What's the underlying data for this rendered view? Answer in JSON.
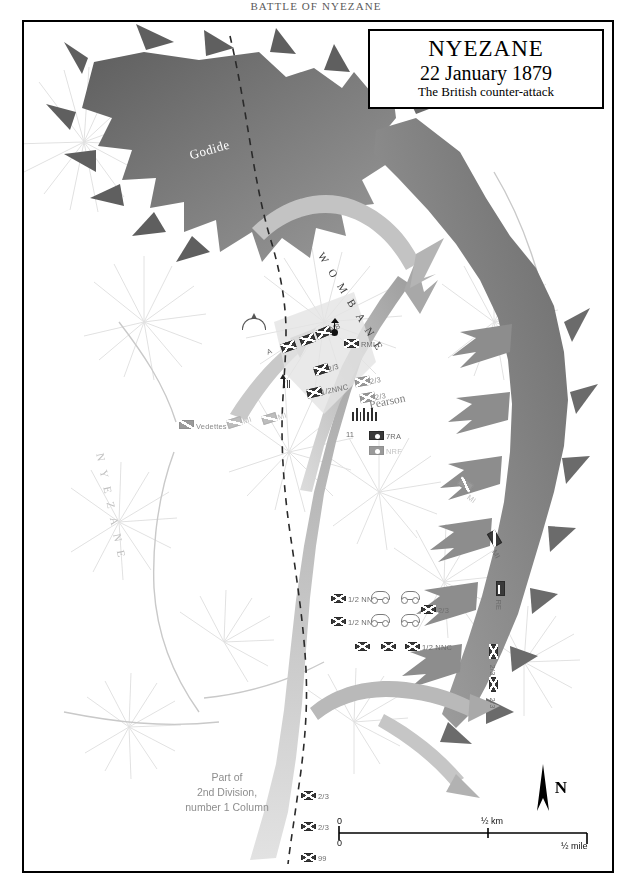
{
  "running_head": "BATTLE OF NYEZANE",
  "title_box": {
    "line1": "NYEZANE",
    "line2": "22 January 1879",
    "line3": "The British counter-attack"
  },
  "place_labels": {
    "godide": "Godide",
    "wombane": "WOMBANE",
    "nyezane": "NYEZANE",
    "commander": "Pearson"
  },
  "note": {
    "line1": "Part of",
    "line2": "2nd Division,",
    "line3": "number 1 Column"
  },
  "scale": {
    "km_zero": "0",
    "km_half": "½ km",
    "mile_zero": "0",
    "mile_half": "½ mile"
  },
  "north": {
    "label": "N"
  },
  "units": [
    {
      "id": "u-a",
      "label": "A",
      "type": "infantry",
      "shade": "dark",
      "x": 257,
      "y": 320,
      "rot": -20,
      "lx": 243,
      "ly": 326,
      "fade": "dk"
    },
    {
      "id": "u-a2",
      "label": "A",
      "type": "infantry",
      "shade": "dark",
      "x": 276,
      "y": 313,
      "rot": -20,
      "lx": 264,
      "ly": 318,
      "fade": "dk"
    },
    {
      "id": "u-nb",
      "label": "NB",
      "type": "infantry",
      "shade": "dark",
      "x": 292,
      "y": 306,
      "rot": -22,
      "lx": 306,
      "ly": 303,
      "fade": "dk"
    },
    {
      "id": "u-rmli",
      "label": "RMLI",
      "type": "infantry",
      "shade": "dark",
      "x": 320,
      "y": 317,
      "rot": 0,
      "lx": 337,
      "ly": 318,
      "fade": "dk"
    },
    {
      "id": "u-23a",
      "label": "2/3",
      "type": "infantry",
      "shade": "dark",
      "x": 290,
      "y": 343,
      "rot": -18,
      "lx": 304,
      "ly": 343,
      "fade": "dk"
    },
    {
      "id": "u-12nnc-a",
      "label": "1/2NNC",
      "type": "infantry",
      "shade": "dark",
      "x": 283,
      "y": 366,
      "rot": -12,
      "lx": 297,
      "ly": 366,
      "fade": "dk"
    },
    {
      "id": "u-23b",
      "label": "2/3",
      "type": "infantry",
      "shade": "mid",
      "x": 331,
      "y": 355,
      "rot": -10,
      "lx": 346,
      "ly": 355,
      "fade": ""
    },
    {
      "id": "u-23c",
      "label": "2/3",
      "type": "infantry",
      "shade": "mid",
      "x": 336,
      "y": 371,
      "rot": -10,
      "lx": 351,
      "ly": 371,
      "fade": ""
    },
    {
      "id": "u-ved",
      "label": "Vedettes",
      "type": "cavalry",
      "shade": "mid",
      "x": 155,
      "y": 398,
      "rot": 0,
      "lx": 172,
      "ly": 400,
      "fade": ""
    },
    {
      "id": "u-mi-a",
      "label": "MI",
      "type": "cavalry",
      "shade": "faint",
      "x": 203,
      "y": 396,
      "rot": -18,
      "lx": 219,
      "ly": 395,
      "fade": "faint"
    },
    {
      "id": "u-mi-b",
      "label": "MI",
      "type": "cavalry",
      "shade": "faint",
      "x": 238,
      "y": 392,
      "rot": -18,
      "lx": 254,
      "ly": 391,
      "fade": "faint"
    },
    {
      "id": "u-7ra",
      "label": "7RA",
      "type": "artillery",
      "shade": "dark",
      "x": 345,
      "y": 409,
      "rot": 0,
      "lx": 362,
      "ly": 410,
      "fade": "dk"
    },
    {
      "id": "u-nrf",
      "label": "NRF",
      "type": "artillery",
      "shade": "mid",
      "x": 345,
      "y": 424,
      "rot": 0,
      "lx": 362,
      "ly": 425,
      "fade": "faint"
    },
    {
      "id": "u-mi-c",
      "label": "MI",
      "type": "cavalry",
      "shade": "mid",
      "x": 434,
      "y": 458,
      "rot": 35,
      "lx": 444,
      "ly": 470,
      "fade": "faint"
    },
    {
      "id": "u-mi-d",
      "label": "MI",
      "type": "cavalry",
      "shade": "dark",
      "x": 463,
      "y": 512,
      "rot": 60,
      "lx": 470,
      "ly": 524,
      "fade": "dk"
    },
    {
      "id": "u-2re",
      "label": "RE",
      "type": "engineer",
      "shade": "dark",
      "x": 469,
      "y": 562,
      "rot": 90,
      "lx": 474,
      "ly": 573,
      "fade": "dk"
    },
    {
      "id": "u-23d",
      "label": "2/3",
      "type": "infantry",
      "shade": "dark",
      "x": 462,
      "y": 625,
      "rot": 90,
      "lx": 468,
      "ly": 638,
      "fade": "dk"
    },
    {
      "id": "u-23e",
      "label": "2/3",
      "type": "infantry",
      "shade": "dark",
      "x": 462,
      "y": 658,
      "rot": 90,
      "lx": 468,
      "ly": 671,
      "fade": "dk"
    },
    {
      "id": "u-12nnc-b",
      "label": "1/2 NNC",
      "type": "infantry",
      "shade": "dark",
      "x": 307,
      "y": 572,
      "rot": 0,
      "lx": 324,
      "ly": 573,
      "fade": "dk"
    },
    {
      "id": "u-12nnc-c",
      "label": "1/2 NNC",
      "type": "infantry",
      "shade": "dark",
      "x": 307,
      "y": 595,
      "rot": 0,
      "lx": 324,
      "ly": 596,
      "fade": "dk"
    },
    {
      "id": "u-23f",
      "label": "2/3",
      "type": "infantry",
      "shade": "dark",
      "x": 397,
      "y": 583,
      "rot": 0,
      "lx": 414,
      "ly": 584,
      "fade": "dk"
    },
    {
      "id": "u-12nnc-d",
      "label": "",
      "type": "infantry",
      "shade": "dark",
      "x": 331,
      "y": 620,
      "rot": 0,
      "lx": 0,
      "ly": 0,
      "fade": "dk"
    },
    {
      "id": "u-12nnc-e",
      "label": "",
      "type": "infantry",
      "shade": "dark",
      "x": 357,
      "y": 620,
      "rot": 0,
      "lx": 0,
      "ly": 0,
      "fade": "dk"
    },
    {
      "id": "u-12nnc-f",
      "label": "1/2 NNC",
      "type": "infantry",
      "shade": "dark",
      "x": 381,
      "y": 620,
      "rot": 0,
      "lx": 398,
      "ly": 621,
      "fade": "dk"
    },
    {
      "id": "u-23g",
      "label": "2/3",
      "type": "infantry",
      "shade": "dark",
      "x": 277,
      "y": 769,
      "rot": 0,
      "lx": 294,
      "ly": 770,
      "fade": "dk"
    },
    {
      "id": "u-23h",
      "label": "2/3",
      "type": "infantry",
      "shade": "dark",
      "x": 277,
      "y": 800,
      "rot": 0,
      "lx": 294,
      "ly": 801,
      "fade": "dk"
    },
    {
      "id": "u-99",
      "label": "99",
      "type": "infantry",
      "shade": "dark",
      "x": 277,
      "y": 831,
      "rot": 0,
      "lx": 294,
      "ly": 832,
      "fade": "dk"
    }
  ],
  "wagons": [
    {
      "id": "wg1",
      "x": 347,
      "y": 569
    },
    {
      "id": "wg2",
      "x": 377,
      "y": 569
    },
    {
      "id": "wg3",
      "x": 347,
      "y": 592
    },
    {
      "id": "wg4",
      "x": 377,
      "y": 592
    }
  ],
  "artillery_count": "11",
  "colors": {
    "zulu_arrow": "#6e6e6e",
    "british_arrow": "#b9b9b9",
    "terrain_hachure": "#d8d8d8",
    "frame": "#000000",
    "label_grey": "#8b8b8b"
  }
}
